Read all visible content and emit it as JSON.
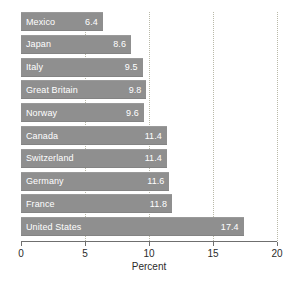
{
  "chart_data": {
    "type": "bar",
    "orientation": "horizontal",
    "title": "",
    "subtitle": "",
    "xlabel": "Percent",
    "ylabel": "",
    "xlim": [
      0,
      20
    ],
    "xticks": [
      0,
      5,
      10,
      15,
      20
    ],
    "xticklabels": [
      "0",
      "5",
      "10",
      "15",
      "20"
    ],
    "grid": "vertical-dotted",
    "legend": "none",
    "categories": [
      "Mexico",
      "Japan",
      "Italy",
      "Great Britain",
      "Norway",
      "Canada",
      "Switzerland",
      "Germany",
      "France",
      "United States"
    ],
    "values": [
      6.4,
      8.6,
      9.5,
      9.8,
      9.6,
      11.4,
      11.4,
      11.6,
      11.8,
      17.4
    ],
    "value_labels": [
      "6.4",
      "8.6",
      "9.5",
      "9.8",
      "9.6",
      "11.4",
      "11.4",
      "11.6",
      "11.8",
      "17.4"
    ],
    "bar_color": "#8f8f8f",
    "bar_label_color": "#ffffff",
    "gridline_color": "#b9b9a8",
    "axis_color": "#6f6f6f",
    "background": "#ffffff"
  },
  "axis": {
    "title": "Percent",
    "ticks": [
      {
        "value": 0,
        "label": "0"
      },
      {
        "value": 5,
        "label": "5"
      },
      {
        "value": 10,
        "label": "10"
      },
      {
        "value": 15,
        "label": "15"
      },
      {
        "value": 20,
        "label": "20"
      }
    ]
  },
  "bars": [
    {
      "label": "Mexico",
      "value": 6.4,
      "value_label": "6.4"
    },
    {
      "label": "Japan",
      "value": 8.6,
      "value_label": "8.6"
    },
    {
      "label": "Italy",
      "value": 9.5,
      "value_label": "9.5"
    },
    {
      "label": "Great Britain",
      "value": 9.8,
      "value_label": "9.8"
    },
    {
      "label": "Norway",
      "value": 9.6,
      "value_label": "9.6"
    },
    {
      "label": "Canada",
      "value": 11.4,
      "value_label": "11.4"
    },
    {
      "label": "Switzerland",
      "value": 11.4,
      "value_label": "11.4"
    },
    {
      "label": "Germany",
      "value": 11.6,
      "value_label": "11.6"
    },
    {
      "label": "France",
      "value": 11.8,
      "value_label": "11.8"
    },
    {
      "label": "United States",
      "value": 17.4,
      "value_label": "17.4"
    }
  ]
}
